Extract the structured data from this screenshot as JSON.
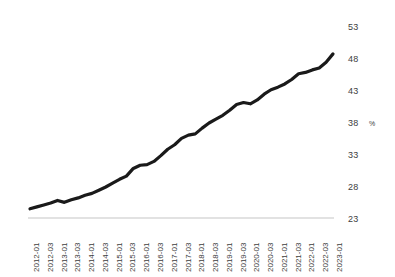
{
  "chart_data": {
    "type": "line",
    "title": "",
    "subtitle": "",
    "xlabel": "",
    "ylabel": "%",
    "unit_label": "%",
    "ylim": [
      23,
      53
    ],
    "y_ticks": [
      23,
      28,
      33,
      38,
      43,
      48,
      53
    ],
    "grid": false,
    "legend": null,
    "legend_position": "none",
    "line_color": "#1a1a1a",
    "axis_color": "#d9d9d9",
    "tick_label_color": "#3d3d3d",
    "x_tick_labels": [
      "2012-01",
      "2012-03",
      "2013-01",
      "2013-03",
      "2014-01",
      "2014-03",
      "2015-01",
      "2015-03",
      "2016-01",
      "2016-03",
      "2017-01",
      "2017-03",
      "2018-01",
      "2018-03",
      "2019-01",
      "2019-03",
      "2020-01",
      "2020-03",
      "2021-01",
      "2021-03",
      "2022-01",
      "2022-03",
      "2023-01"
    ],
    "x": [
      "2012-01",
      "2012-02",
      "2012-03",
      "2012-04",
      "2013-01",
      "2013-02",
      "2013-03",
      "2013-04",
      "2014-01",
      "2014-02",
      "2014-03",
      "2014-04",
      "2015-01",
      "2015-02",
      "2015-03",
      "2015-04",
      "2016-01",
      "2016-02",
      "2016-03",
      "2016-04",
      "2017-01",
      "2017-02",
      "2017-03",
      "2017-04",
      "2018-01",
      "2018-02",
      "2018-03",
      "2018-04",
      "2019-01",
      "2019-02",
      "2019-03",
      "2019-04",
      "2020-01",
      "2020-02",
      "2020-03",
      "2020-04",
      "2021-01",
      "2021-02",
      "2021-03",
      "2021-04",
      "2022-01",
      "2022-02",
      "2022-03",
      "2022-04",
      "2023-01"
    ],
    "values": [
      24.6,
      24.9,
      25.2,
      25.5,
      25.9,
      25.6,
      26.0,
      26.3,
      26.7,
      27.0,
      27.5,
      28.0,
      28.6,
      29.2,
      29.7,
      30.9,
      31.4,
      31.5,
      32.0,
      32.9,
      33.9,
      34.6,
      35.6,
      36.1,
      36.3,
      37.2,
      38.0,
      38.6,
      39.2,
      40.0,
      40.9,
      41.2,
      41.0,
      41.6,
      42.5,
      43.2,
      43.6,
      44.1,
      44.8,
      45.7,
      45.9,
      46.3,
      46.6,
      47.5,
      48.8
    ]
  }
}
